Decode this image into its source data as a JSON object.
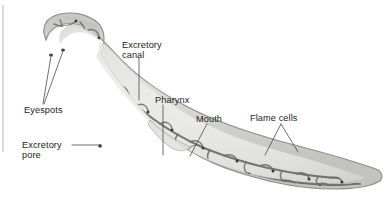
{
  "figure": {
    "background_color": "#ffffff",
    "body_fill_color": "#c9c9c6",
    "body_interior_color": "#ececea",
    "canal_color": "#6b6b6b",
    "label_color": "#231f20",
    "leader_color": "#4a4a4a",
    "margin_rule_color": "#b9b9b9"
  },
  "labels": [
    {
      "id": "excretory-canal",
      "lines": [
        "Excretory",
        "canal"
      ],
      "line1": "Excretory",
      "line2": "canal",
      "x": 122,
      "y": 44,
      "anchor": "start"
    },
    {
      "id": "pharynx",
      "lines": [
        "Pharynx"
      ],
      "line1": "Pharynx",
      "line2": "",
      "x": 155,
      "y": 100,
      "anchor": "start"
    },
    {
      "id": "mouth",
      "lines": [
        "Mouth"
      ],
      "line1": "Mouth",
      "line2": "",
      "x": 196,
      "y": 119,
      "anchor": "start"
    },
    {
      "id": "flame-cells",
      "lines": [
        "Flame cells"
      ],
      "line1": "Flame cells",
      "line2": "",
      "x": 250,
      "y": 118,
      "anchor": "start"
    },
    {
      "id": "eyespots",
      "lines": [
        "Eyespots"
      ],
      "line1": "Eyespots",
      "line2": "",
      "x": 24,
      "y": 110,
      "anchor": "start"
    },
    {
      "id": "excretory-pore",
      "lines": [
        "Excretory",
        "pore"
      ],
      "line1": "Excretory",
      "line2": "pore",
      "x": 22,
      "y": 148,
      "anchor": "start"
    }
  ]
}
